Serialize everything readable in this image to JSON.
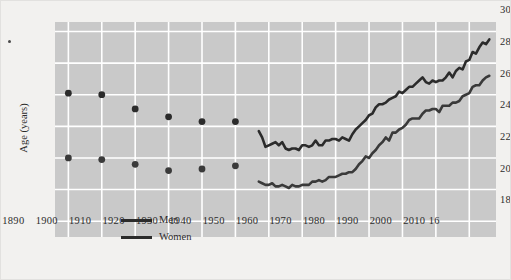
{
  "chart_data": {
    "type": "line",
    "title": "",
    "subtitle": "",
    "xlabel": "",
    "ylabel": "Age (years)",
    "xlim": [
      1886,
      2018
    ],
    "ylim": [
      17,
      30.6
    ],
    "yticks": [
      18,
      20,
      22,
      24,
      26,
      28,
      30
    ],
    "ytick_labels": [
      "18",
      "20",
      "22",
      "24",
      "26",
      "28",
      "30"
    ],
    "xticks": [
      1890,
      1900,
      1910,
      1920,
      1930,
      1940,
      1950,
      1960,
      1970,
      1980,
      1990,
      2000,
      2010,
      2016
    ],
    "xtick_labels": [
      "1890",
      "1900",
      "1910",
      "1920",
      "1930",
      "1940",
      "1950",
      "1960",
      "1970",
      "1980",
      "1990",
      "2000",
      "2010",
      "16"
    ],
    "grid": true,
    "legend_position": "lower-left-inside",
    "legend": [
      "Men",
      "Women"
    ],
    "series": [
      {
        "name": "Men",
        "color": "#2b2b2b",
        "marker_points": {
          "x": [
            1890,
            1900,
            1910,
            1920,
            1930,
            1940
          ],
          "y": [
            26.1,
            26.0,
            25.1,
            24.6,
            24.3,
            24.3
          ]
        },
        "line_points": {
          "x": [
            1947,
            1948,
            1949,
            1950,
            1951,
            1952,
            1953,
            1954,
            1955,
            1956,
            1957,
            1958,
            1959,
            1960,
            1961,
            1962,
            1963,
            1964,
            1965,
            1966,
            1967,
            1968,
            1969,
            1970,
            1971,
            1972,
            1973,
            1974,
            1975,
            1976,
            1977,
            1978,
            1979,
            1980,
            1981,
            1982,
            1983,
            1984,
            1985,
            1986,
            1987,
            1988,
            1989,
            1990,
            1991,
            1992,
            1993,
            1994,
            1995,
            1996,
            1997,
            1998,
            1999,
            2000,
            2001,
            2002,
            2003,
            2004,
            2005,
            2006,
            2007,
            2008,
            2009,
            2010,
            2011,
            2012,
            2013,
            2014,
            2015,
            2016
          ],
          "y": [
            23.7,
            23.3,
            22.7,
            22.8,
            22.9,
            23.0,
            22.8,
            23.0,
            22.6,
            22.5,
            22.6,
            22.6,
            22.5,
            22.8,
            22.8,
            22.7,
            22.8,
            23.1,
            22.8,
            22.8,
            23.1,
            23.1,
            23.2,
            23.2,
            23.1,
            23.3,
            23.2,
            23.1,
            23.5,
            23.8,
            24.0,
            24.2,
            24.4,
            24.7,
            24.8,
            25.2,
            25.4,
            25.4,
            25.5,
            25.7,
            25.8,
            25.9,
            26.2,
            26.1,
            26.3,
            26.5,
            26.5,
            26.7,
            26.9,
            27.1,
            26.8,
            26.7,
            26.9,
            26.8,
            26.9,
            26.9,
            27.1,
            27.4,
            27.1,
            27.5,
            27.7,
            27.6,
            28.1,
            28.2,
            28.7,
            28.6,
            29.0,
            29.3,
            29.2,
            29.5
          ]
        }
      },
      {
        "name": "Women",
        "color": "#3a3a3a",
        "marker_points": {
          "x": [
            1890,
            1900,
            1910,
            1920,
            1930,
            1940
          ],
          "y": [
            22.0,
            21.9,
            21.6,
            21.2,
            21.3,
            21.5
          ]
        },
        "line_points": {
          "x": [
            1947,
            1948,
            1949,
            1950,
            1951,
            1952,
            1953,
            1954,
            1955,
            1956,
            1957,
            1958,
            1959,
            1960,
            1961,
            1962,
            1963,
            1964,
            1965,
            1966,
            1967,
            1968,
            1969,
            1970,
            1971,
            1972,
            1973,
            1974,
            1975,
            1976,
            1977,
            1978,
            1979,
            1980,
            1981,
            1982,
            1983,
            1984,
            1985,
            1986,
            1987,
            1988,
            1989,
            1990,
            1991,
            1992,
            1993,
            1994,
            1995,
            1996,
            1997,
            1998,
            1999,
            2000,
            2001,
            2002,
            2003,
            2004,
            2005,
            2006,
            2007,
            2008,
            2009,
            2010,
            2011,
            2012,
            2013,
            2014,
            2015,
            2016
          ],
          "y": [
            20.5,
            20.4,
            20.3,
            20.3,
            20.4,
            20.2,
            20.2,
            20.3,
            20.2,
            20.1,
            20.3,
            20.2,
            20.2,
            20.3,
            20.3,
            20.3,
            20.5,
            20.5,
            20.6,
            20.5,
            20.6,
            20.8,
            20.8,
            20.8,
            20.9,
            21.0,
            21.0,
            21.1,
            21.1,
            21.3,
            21.6,
            21.8,
            22.1,
            22.0,
            22.3,
            22.5,
            22.8,
            23.0,
            23.3,
            23.1,
            23.6,
            23.6,
            23.8,
            23.9,
            24.1,
            24.4,
            24.5,
            24.5,
            24.5,
            24.8,
            25.0,
            25.0,
            25.1,
            25.1,
            24.9,
            25.3,
            25.3,
            25.3,
            25.5,
            25.5,
            25.6,
            25.9,
            26.0,
            26.1,
            26.5,
            26.6,
            26.6,
            26.9,
            27.1,
            27.2
          ]
        }
      }
    ]
  }
}
